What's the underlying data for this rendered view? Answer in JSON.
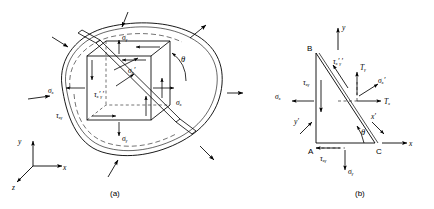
{
  "figure": {
    "stroke_color": "#000000",
    "background_color": "#ffffff"
  },
  "panel_a": {
    "caption": "(a)",
    "description": "Loaded body with embedded cubic stress element rotated by theta",
    "labels": {
      "sigma_x_left": "σₓ",
      "sigma_x_right": "σₓ",
      "sigma_y_top": "σᵧ",
      "sigma_y_bottom": "σᵧ",
      "tau_xy": "τₓᵧ",
      "sigma_xp": "σₓ′",
      "tau_xpyp": "τₓ′ᵧ′",
      "theta": "θ"
    },
    "axes": {
      "x": "x",
      "y": "y",
      "z": "z"
    }
  },
  "panel_b": {
    "caption": "(b)",
    "description": "Wedge free-body diagram ABC with inclined face",
    "vertices": {
      "A": "A",
      "B": "B",
      "C": "C"
    },
    "axes": {
      "x": "x",
      "y": "y",
      "x_prime": "x′",
      "y_prime": "y′"
    },
    "labels": {
      "tau_xy_left": "τₓᵧ",
      "sigma_x": "σₓ",
      "tau_xpyp": "τₓ′ᵧ′",
      "T_y": "Tᵧ",
      "T_x": "Tₓ",
      "sigma_xp": "σₓ′",
      "tau_xy_bottom": "τₓᵧ",
      "sigma_y": "σᵧ",
      "theta": "θ"
    }
  }
}
